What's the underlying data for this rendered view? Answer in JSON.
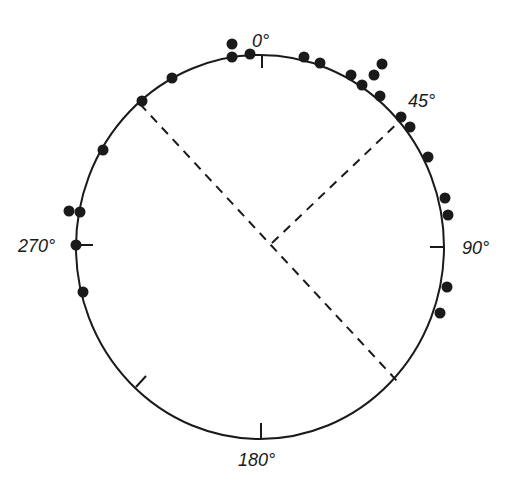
{
  "diagram": {
    "type": "circular-data-plot",
    "colors": {
      "ink": "#1a1a1a",
      "background": "#ffffff"
    },
    "center": [
      260,
      247
    ],
    "radius_x": 184,
    "radius_y": 192,
    "labels": {
      "north": "0°",
      "east": "90°",
      "south": "180°",
      "west": "270°",
      "northeast": "45°"
    },
    "ticks_deg": [
      0,
      90,
      180,
      225,
      270
    ],
    "mean_directions": [
      {
        "name": "axis-line",
        "from": [
          140,
          104
        ],
        "to": [
          398,
          382
        ],
        "style": "dashed"
      },
      {
        "name": "mean-vector-line",
        "from": [
          272,
          243
        ],
        "to": [
          403,
          118
        ],
        "style": "dashed"
      }
    ],
    "points": [
      [
        232,
        44
      ],
      [
        232,
        57
      ],
      [
        250,
        54
      ],
      [
        304,
        57
      ],
      [
        320,
        63
      ],
      [
        351,
        75
      ],
      [
        362,
        85
      ],
      [
        374,
        75
      ],
      [
        382,
        64
      ],
      [
        380,
        96
      ],
      [
        401,
        117
      ],
      [
        410,
        127
      ],
      [
        428,
        157
      ],
      [
        445,
        198
      ],
      [
        448,
        215
      ],
      [
        447,
        287
      ],
      [
        440,
        313
      ],
      [
        172,
        78
      ],
      [
        142,
        101
      ],
      [
        103,
        150
      ],
      [
        69,
        211
      ],
      [
        80,
        212
      ],
      [
        76,
        245
      ],
      [
        83,
        292
      ]
    ]
  },
  "chart_data": {
    "type": "scatter",
    "title": "",
    "axis_labels": [
      "0°",
      "45°",
      "90°",
      "180°",
      "270°"
    ],
    "points_deg_approx": [
      350,
      350,
      355,
      13,
      18,
      28,
      32,
      32,
      36,
      37,
      42,
      44,
      46,
      56,
      72,
      77,
      103,
      111,
      298,
      306,
      318,
      280,
      280,
      270,
      258
    ],
    "mean_direction_deg_approx": 45,
    "axis_direction_deg_approx": [
      318,
      138
    ]
  }
}
